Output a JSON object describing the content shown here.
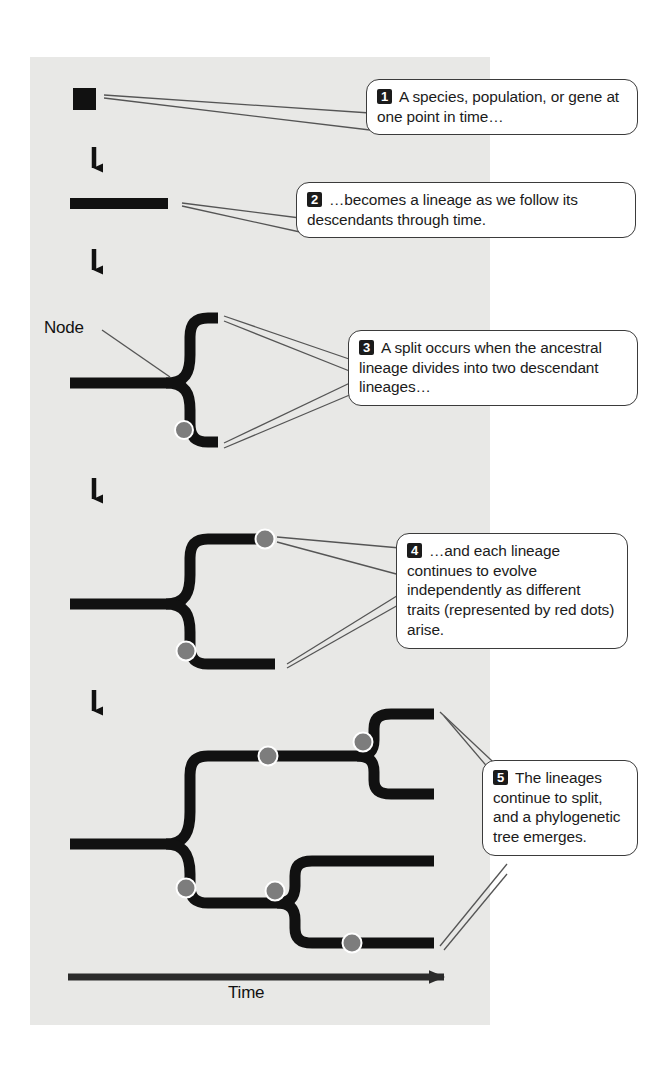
{
  "figure": {
    "panel_color": "#e8e8e6",
    "line_color": "#111111",
    "dot_color": "#7d7d7d",
    "dot_stroke": "#ffffff",
    "callout_border": "#3b3b3b",
    "callout_fill": "#ffffff",
    "badge_fill": "#1b1b1b",
    "badge_text_color": "#ffffff"
  },
  "labels": {
    "node": "Node",
    "time_axis": "Time"
  },
  "callouts": [
    {
      "number": "1",
      "text": "A species, population, or gene at one point in time…"
    },
    {
      "number": "2",
      "text": "…becomes a lineage as we follow its descendants through time."
    },
    {
      "number": "3",
      "text": "A split occurs when the ancestral lineage divides into two descendant lineages…"
    },
    {
      "number": "4",
      "text": "…and each lineage continues to evolve independently as different traits (represented by red dots) arise."
    },
    {
      "number": "5",
      "text": "The lineages continue to split, and a phylogenetic tree emerges."
    }
  ],
  "stages": [
    {
      "id": "stage-1",
      "name": "single-point-square",
      "description": "A filled square representing a species, population, or gene at one point in time."
    },
    {
      "id": "stage-2",
      "name": "lineage-bar",
      "description": "A horizontal thick bar representing a lineage followed through time."
    },
    {
      "id": "stage-3",
      "name": "first-split",
      "description": "Ancestral lineage splits at a node into two descendant lineages.",
      "nodes": 1,
      "trait_dots": 1
    },
    {
      "id": "stage-4",
      "name": "lineages-with-traits",
      "description": "Two lineages evolving independently, each accumulating trait dots.",
      "nodes": 1,
      "trait_dots": 2
    },
    {
      "id": "stage-5",
      "name": "phylogenetic-tree",
      "description": "Full phylogenetic tree with multiple splits and trait dots.",
      "nodes": 3,
      "trait_dots": 6
    }
  ],
  "arrows": {
    "between_stages_count": 4,
    "direction": "down",
    "time_axis_direction": "right"
  }
}
